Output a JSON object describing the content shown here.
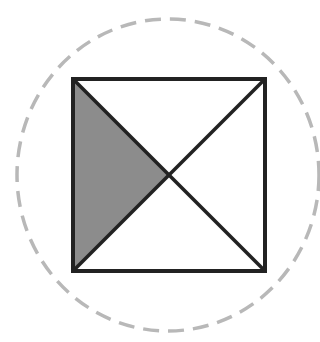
{
  "figure": {
    "canvas": {
      "width": 320,
      "height": 342,
      "background": "#ffffff"
    },
    "circle": {
      "cx": 168,
      "cy": 175,
      "rx": 151,
      "ry": 156,
      "stroke": "#b8b8b8",
      "stroke_width": 3.5,
      "dash": "16 9"
    },
    "square": {
      "x": 73,
      "y": 79,
      "size": 192,
      "stroke": "#222222",
      "stroke_width": 4
    },
    "center": {
      "x": 169,
      "y": 175
    },
    "shaded_region": {
      "name": "left-triangle",
      "fill": "#8c8c8c"
    },
    "diagonal_stroke": "#222222",
    "diagonal_width": 3.5
  }
}
